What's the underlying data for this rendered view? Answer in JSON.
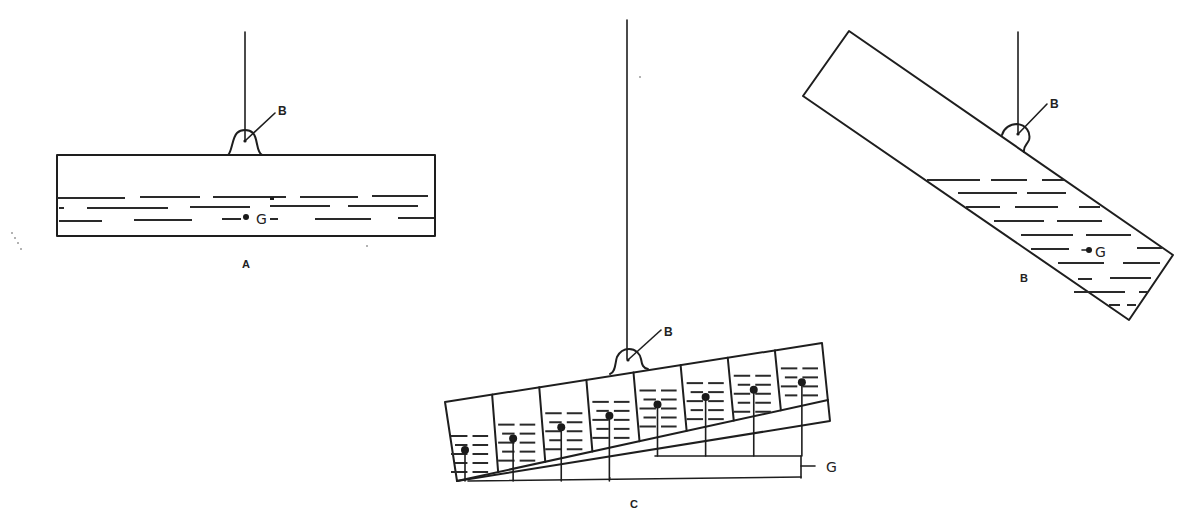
{
  "figure": {
    "type": "physics diagram: suspended containers with liquid, buoyancy point B and center of gravity G",
    "colors": {
      "ink": "#1e1e1e",
      "background": "#ffffff"
    },
    "panels": [
      {
        "id": "A",
        "caption": "A",
        "description": "Level box suspended from point B with liquid layer in bottom; G in liquid",
        "labels": {
          "suspension_point": "B",
          "center_of_gravity": "G"
        }
      },
      {
        "id": "B",
        "caption": "B",
        "description": "Tilted box suspended from B; liquid shifted to the lower end; G in liquid",
        "labels": {
          "suspension_point": "B",
          "center_of_gravity": "G"
        }
      },
      {
        "id": "C",
        "caption": "C",
        "description": "Slightly tilted box divided into 8 compartments, each with liquid and its own G point, all bracketed to label G",
        "compartments": 8,
        "labels": {
          "suspension_point": "B",
          "center_of_gravity": "G"
        }
      }
    ]
  }
}
